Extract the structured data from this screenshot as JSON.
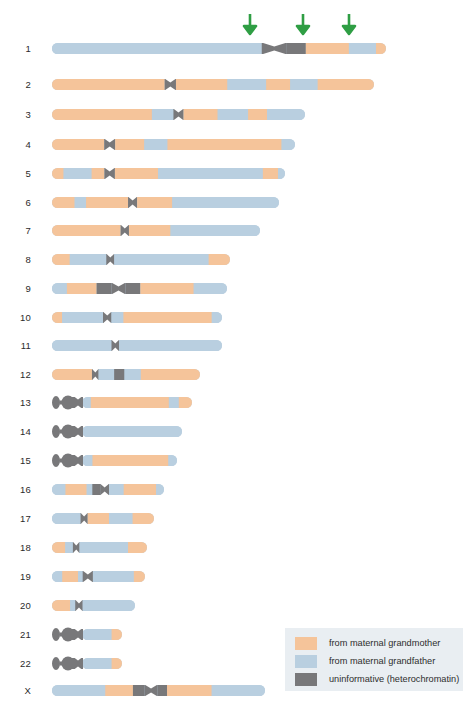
{
  "figure": {
    "type": "karyogram",
    "background": "#ffffff"
  },
  "colors": {
    "grandmother": "#f5c49a",
    "grandfather": "#b9cfe0",
    "heterochromatin": "#78787a",
    "arrow": "#2f9e44",
    "legend_background": "#e9eef2",
    "label_text": "#2b2b2b"
  },
  "legend": {
    "items": [
      {
        "swatch_color": "#f5c49a",
        "label": "from maternal grandmother"
      },
      {
        "swatch_color": "#b9cfe0",
        "label": "from maternal grandfather"
      },
      {
        "swatch_color": "#78787a",
        "label": "uninformative (heterochromatin)"
      }
    ]
  },
  "arrows": [
    {
      "x_pct": 59.4,
      "label": "crossover-marker-1"
    },
    {
      "x_pct": 75.2,
      "label": "crossover-marker-2"
    },
    {
      "x_pct": 88.9,
      "label": "crossover-marker-3"
    }
  ],
  "chromosomes": [
    {
      "name": "1",
      "y": 48,
      "x": 52,
      "length": 334,
      "acrocentric": false,
      "segments": [
        {
          "start": 0,
          "end": 62.8,
          "color": "grandfather"
        },
        {
          "start": 62.8,
          "end": 70.3,
          "color": "heterochromatin",
          "shape": "centromere"
        },
        {
          "start": 70.3,
          "end": 76.0,
          "color": "heterochromatin"
        },
        {
          "start": 76.0,
          "end": 88.9,
          "color": "grandmother"
        },
        {
          "start": 88.9,
          "end": 97.0,
          "color": "grandfather"
        },
        {
          "start": 97.0,
          "end": 100,
          "color": "grandmother"
        }
      ]
    },
    {
      "name": "2",
      "y": 84,
      "x": 52,
      "length": 322,
      "acrocentric": false,
      "segments": [
        {
          "start": 0,
          "end": 35.0,
          "color": "grandmother"
        },
        {
          "start": 35.0,
          "end": 38.5,
          "color": "heterochromatin",
          "shape": "centromere"
        },
        {
          "start": 38.5,
          "end": 54.5,
          "color": "grandmother"
        },
        {
          "start": 54.5,
          "end": 66.5,
          "color": "grandfather"
        },
        {
          "start": 66.5,
          "end": 74.0,
          "color": "grandmother"
        },
        {
          "start": 74.0,
          "end": 82.5,
          "color": "grandfather"
        },
        {
          "start": 82.5,
          "end": 100,
          "color": "grandmother"
        }
      ]
    },
    {
      "name": "3",
      "y": 114,
      "x": 52,
      "length": 253,
      "acrocentric": false,
      "segments": [
        {
          "start": 0,
          "end": 39.5,
          "color": "grandmother"
        },
        {
          "start": 39.5,
          "end": 48.0,
          "color": "grandfather"
        },
        {
          "start": 48.0,
          "end": 52.0,
          "color": "heterochromatin",
          "shape": "centromere"
        },
        {
          "start": 52.0,
          "end": 65.5,
          "color": "grandmother"
        },
        {
          "start": 65.5,
          "end": 77.5,
          "color": "grandfather"
        },
        {
          "start": 77.5,
          "end": 85.0,
          "color": "grandmother"
        },
        {
          "start": 85.0,
          "end": 100,
          "color": "grandfather"
        }
      ]
    },
    {
      "name": "4",
      "y": 144,
      "x": 52,
      "length": 243,
      "acrocentric": false,
      "segments": [
        {
          "start": 0,
          "end": 21.5,
          "color": "grandmother"
        },
        {
          "start": 21.5,
          "end": 26.0,
          "color": "heterochromatin",
          "shape": "centromere"
        },
        {
          "start": 26.0,
          "end": 38.0,
          "color": "grandmother"
        },
        {
          "start": 38.0,
          "end": 47.5,
          "color": "grandfather"
        },
        {
          "start": 47.5,
          "end": 94.5,
          "color": "grandmother"
        },
        {
          "start": 94.5,
          "end": 100,
          "color": "grandfather"
        }
      ]
    },
    {
      "name": "5",
      "y": 173,
      "x": 52,
      "length": 233,
      "acrocentric": false,
      "segments": [
        {
          "start": 0,
          "end": 5.0,
          "color": "grandmother"
        },
        {
          "start": 5.0,
          "end": 17.0,
          "color": "grandfather"
        },
        {
          "start": 17.0,
          "end": 22.5,
          "color": "grandmother"
        },
        {
          "start": 22.5,
          "end": 27.0,
          "color": "heterochromatin",
          "shape": "centromere"
        },
        {
          "start": 27.0,
          "end": 45.5,
          "color": "grandmother"
        },
        {
          "start": 45.5,
          "end": 90.5,
          "color": "grandfather"
        },
        {
          "start": 90.5,
          "end": 97.0,
          "color": "grandmother"
        },
        {
          "start": 97.0,
          "end": 100,
          "color": "grandfather"
        }
      ]
    },
    {
      "name": "6",
      "y": 202,
      "x": 52,
      "length": 227,
      "acrocentric": false,
      "segments": [
        {
          "start": 0,
          "end": 10.0,
          "color": "grandmother"
        },
        {
          "start": 10.0,
          "end": 15.0,
          "color": "grandfather"
        },
        {
          "start": 15.0,
          "end": 33.5,
          "color": "grandmother"
        },
        {
          "start": 33.5,
          "end": 37.5,
          "color": "heterochromatin",
          "shape": "centromere"
        },
        {
          "start": 37.5,
          "end": 53.0,
          "color": "grandmother"
        },
        {
          "start": 53.0,
          "end": 100,
          "color": "grandfather"
        }
      ]
    },
    {
      "name": "7",
      "y": 230,
      "x": 52,
      "length": 208,
      "acrocentric": false,
      "segments": [
        {
          "start": 0,
          "end": 33.0,
          "color": "grandmother"
        },
        {
          "start": 33.0,
          "end": 37.0,
          "color": "heterochromatin",
          "shape": "centromere"
        },
        {
          "start": 37.0,
          "end": 57.0,
          "color": "grandmother"
        },
        {
          "start": 57.0,
          "end": 100,
          "color": "grandfather"
        }
      ]
    },
    {
      "name": "8",
      "y": 259,
      "x": 52,
      "length": 178,
      "acrocentric": false,
      "segments": [
        {
          "start": 0,
          "end": 10.0,
          "color": "grandmother"
        },
        {
          "start": 10.0,
          "end": 30.5,
          "color": "grandfather"
        },
        {
          "start": 30.5,
          "end": 35.0,
          "color": "heterochromatin",
          "shape": "centromere"
        },
        {
          "start": 35.0,
          "end": 88.0,
          "color": "grandfather"
        },
        {
          "start": 88.0,
          "end": 100,
          "color": "grandmother"
        }
      ]
    },
    {
      "name": "9",
      "y": 288,
      "x": 52,
      "length": 175,
      "acrocentric": false,
      "segments": [
        {
          "start": 0,
          "end": 8.5,
          "color": "grandfather"
        },
        {
          "start": 8.5,
          "end": 25.5,
          "color": "grandmother"
        },
        {
          "start": 25.5,
          "end": 34.0,
          "color": "heterochromatin"
        },
        {
          "start": 34.0,
          "end": 42.0,
          "color": "heterochromatin",
          "shape": "centromere"
        },
        {
          "start": 42.0,
          "end": 50.5,
          "color": "heterochromatin"
        },
        {
          "start": 50.5,
          "end": 81.0,
          "color": "grandmother"
        },
        {
          "start": 81.0,
          "end": 100,
          "color": "grandfather"
        }
      ]
    },
    {
      "name": "10",
      "y": 317,
      "x": 52,
      "length": 170,
      "acrocentric": false,
      "segments": [
        {
          "start": 0,
          "end": 6.0,
          "color": "grandmother"
        },
        {
          "start": 6.0,
          "end": 30.0,
          "color": "grandfather"
        },
        {
          "start": 30.0,
          "end": 35.0,
          "color": "heterochromatin",
          "shape": "centromere"
        },
        {
          "start": 35.0,
          "end": 42.0,
          "color": "grandfather"
        },
        {
          "start": 42.0,
          "end": 94.0,
          "color": "grandmother"
        },
        {
          "start": 94.0,
          "end": 100,
          "color": "grandfather"
        }
      ]
    },
    {
      "name": "11",
      "y": 345,
      "x": 52,
      "length": 170,
      "acrocentric": false,
      "segments": [
        {
          "start": 0,
          "end": 35.0,
          "color": "grandfather"
        },
        {
          "start": 35.0,
          "end": 39.5,
          "color": "heterochromatin",
          "shape": "centromere"
        },
        {
          "start": 39.5,
          "end": 100,
          "color": "grandfather"
        }
      ]
    },
    {
      "name": "12",
      "y": 374,
      "x": 52,
      "length": 148,
      "acrocentric": false,
      "segments": [
        {
          "start": 0,
          "end": 27.0,
          "color": "grandmother"
        },
        {
          "start": 27.0,
          "end": 31.5,
          "color": "heterochromatin",
          "shape": "centromere"
        },
        {
          "start": 31.5,
          "end": 42.0,
          "color": "grandfather"
        },
        {
          "start": 42.0,
          "end": 49.0,
          "color": "heterochromatin"
        },
        {
          "start": 49.0,
          "end": 60.0,
          "color": "grandfather"
        },
        {
          "start": 60.0,
          "end": 100,
          "color": "grandmother"
        }
      ]
    },
    {
      "name": "13",
      "y": 402,
      "x": 52,
      "length": 140,
      "acrocentric": true,
      "segments": [
        {
          "start": 0,
          "end": 8.0,
          "color": "grandfather"
        },
        {
          "start": 8.0,
          "end": 79.0,
          "color": "grandmother"
        },
        {
          "start": 79.0,
          "end": 88.0,
          "color": "grandfather"
        },
        {
          "start": 88.0,
          "end": 100,
          "color": "grandmother"
        }
      ]
    },
    {
      "name": "14",
      "y": 431,
      "x": 52,
      "length": 130,
      "acrocentric": true,
      "segments": [
        {
          "start": 0,
          "end": 100,
          "color": "grandfather"
        }
      ]
    },
    {
      "name": "15",
      "y": 460,
      "x": 52,
      "length": 125,
      "acrocentric": true,
      "segments": [
        {
          "start": 0,
          "end": 11.0,
          "color": "grandfather"
        },
        {
          "start": 11.0,
          "end": 91.0,
          "color": "grandmother"
        },
        {
          "start": 91.0,
          "end": 100,
          "color": "grandfather"
        }
      ]
    },
    {
      "name": "16",
      "y": 489,
      "x": 52,
      "length": 112,
      "acrocentric": false,
      "segments": [
        {
          "start": 0,
          "end": 12.0,
          "color": "grandfather"
        },
        {
          "start": 12.0,
          "end": 31.0,
          "color": "grandmother"
        },
        {
          "start": 31.0,
          "end": 36.0,
          "color": "grandfather"
        },
        {
          "start": 36.0,
          "end": 43.0,
          "color": "heterochromatin"
        },
        {
          "start": 43.0,
          "end": 51.0,
          "color": "heterochromatin",
          "shape": "centromere"
        },
        {
          "start": 51.0,
          "end": 64.0,
          "color": "grandfather"
        },
        {
          "start": 64.0,
          "end": 93.0,
          "color": "grandmother"
        },
        {
          "start": 93.0,
          "end": 100,
          "color": "grandfather"
        }
      ]
    },
    {
      "name": "17",
      "y": 518,
      "x": 52,
      "length": 102,
      "acrocentric": false,
      "segments": [
        {
          "start": 0,
          "end": 28.0,
          "color": "grandfather"
        },
        {
          "start": 28.0,
          "end": 35.0,
          "color": "heterochromatin",
          "shape": "centromere"
        },
        {
          "start": 35.0,
          "end": 56.0,
          "color": "grandmother"
        },
        {
          "start": 56.0,
          "end": 79.0,
          "color": "grandfather"
        },
        {
          "start": 79.0,
          "end": 100,
          "color": "grandmother"
        }
      ]
    },
    {
      "name": "18",
      "y": 547,
      "x": 52,
      "length": 95,
      "acrocentric": false,
      "segments": [
        {
          "start": 0,
          "end": 14.0,
          "color": "grandmother"
        },
        {
          "start": 14.0,
          "end": 22.0,
          "color": "grandfather"
        },
        {
          "start": 22.0,
          "end": 29.0,
          "color": "heterochromatin",
          "shape": "centromere"
        },
        {
          "start": 29.0,
          "end": 80.0,
          "color": "grandfather"
        },
        {
          "start": 80.0,
          "end": 100,
          "color": "grandmother"
        }
      ]
    },
    {
      "name": "19",
      "y": 576,
      "x": 52,
      "length": 93,
      "acrocentric": false,
      "segments": [
        {
          "start": 0,
          "end": 11.0,
          "color": "grandfather"
        },
        {
          "start": 11.0,
          "end": 28.0,
          "color": "grandmother"
        },
        {
          "start": 28.0,
          "end": 33.0,
          "color": "grandfather"
        },
        {
          "start": 33.0,
          "end": 44.0,
          "color": "heterochromatin",
          "shape": "centromere"
        },
        {
          "start": 44.0,
          "end": 88.0,
          "color": "grandfather"
        },
        {
          "start": 88.0,
          "end": 100,
          "color": "grandmother"
        }
      ]
    },
    {
      "name": "20",
      "y": 605,
      "x": 52,
      "length": 83,
      "acrocentric": false,
      "segments": [
        {
          "start": 0,
          "end": 22.0,
          "color": "grandmother"
        },
        {
          "start": 22.0,
          "end": 28.0,
          "color": "grandfather"
        },
        {
          "start": 28.0,
          "end": 37.0,
          "color": "heterochromatin",
          "shape": "centromere"
        },
        {
          "start": 37.0,
          "end": 100,
          "color": "grandfather"
        }
      ]
    },
    {
      "name": "21",
      "y": 634,
      "x": 52,
      "length": 70,
      "acrocentric": true,
      "segments": [
        {
          "start": 0,
          "end": 74.0,
          "color": "grandfather"
        },
        {
          "start": 74.0,
          "end": 100,
          "color": "grandmother"
        }
      ]
    },
    {
      "name": "22",
      "y": 663,
      "x": 52,
      "length": 70,
      "acrocentric": true,
      "segments": [
        {
          "start": 0,
          "end": 74.0,
          "color": "grandfather"
        },
        {
          "start": 74.0,
          "end": 100,
          "color": "grandmother"
        }
      ]
    },
    {
      "name": "X",
      "y": 690,
      "x": 52,
      "length": 213,
      "acrocentric": false,
      "segments": [
        {
          "start": 0,
          "end": 25.0,
          "color": "grandfather"
        },
        {
          "start": 25.0,
          "end": 38.0,
          "color": "grandmother"
        },
        {
          "start": 38.0,
          "end": 43.5,
          "color": "heterochromatin"
        },
        {
          "start": 43.5,
          "end": 49.5,
          "color": "heterochromatin",
          "shape": "centromere"
        },
        {
          "start": 49.5,
          "end": 54.0,
          "color": "heterochromatin"
        },
        {
          "start": 54.0,
          "end": 75.0,
          "color": "grandmother"
        },
        {
          "start": 75.0,
          "end": 100,
          "color": "grandfather"
        }
      ]
    }
  ]
}
